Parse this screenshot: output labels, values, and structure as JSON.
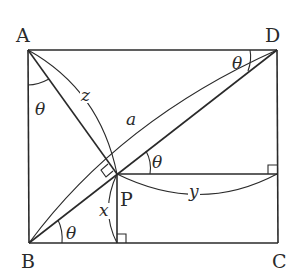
{
  "diagram": {
    "type": "geometry",
    "vertices": {
      "A": "A",
      "B": "B",
      "C": "C",
      "D": "D",
      "P": "P"
    },
    "variables": {
      "z": "z",
      "a": "a",
      "x": "x",
      "y": "y"
    },
    "angle_label": "θ",
    "angles": [
      {
        "at": "A",
        "between": "AB and AP",
        "label": "θ"
      },
      {
        "at": "D",
        "between": "DA and DB",
        "label": "θ"
      },
      {
        "at": "P",
        "between": "PD and horizontal",
        "label": "θ"
      },
      {
        "at": "B",
        "between": "BC and BD",
        "label": "θ"
      }
    ],
    "right_angles": [
      "AP ⟂ BD at P",
      "P foot on BC",
      "P horizontal meets DC"
    ],
    "segments": {
      "z": "AP",
      "a": "BD",
      "x": "P to BC (vertical)",
      "y": "P to DC (horizontal)"
    }
  }
}
